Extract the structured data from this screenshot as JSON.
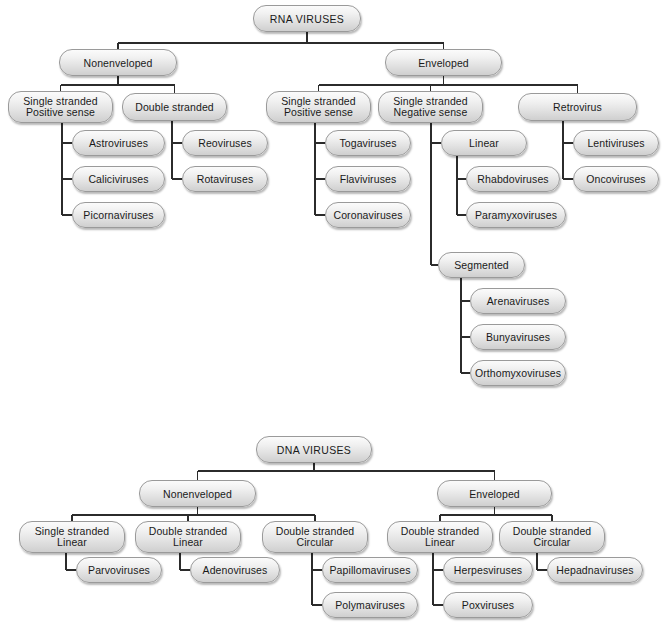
{
  "diagram": {
    "colors": {
      "background": "#ffffff",
      "node_border": "#9a9a9a",
      "node_fill_top": "#fbfbfb",
      "node_fill_bottom": "#cfcfcf",
      "connector": "#2b2b2b",
      "text": "#1a1a1a"
    },
    "trees": [
      {
        "name": "rna-viruses-tree",
        "root": "RNA VIRUSES"
      },
      {
        "name": "dna-viruses-tree",
        "root": "DNA VIRUSES"
      }
    ]
  },
  "nodes": [
    {
      "id": "rna-root",
      "label": "RNA VIRUSES",
      "x": 253,
      "y": 5,
      "w": 108,
      "h": 27,
      "kind": "root",
      "tree": "rna"
    },
    {
      "id": "rna-nonenveloped",
      "label": "Nonenveloped",
      "x": 59,
      "y": 49,
      "w": 118,
      "h": 27,
      "kind": "branch",
      "tree": "rna"
    },
    {
      "id": "rna-enveloped",
      "label": "Enveloped",
      "x": 385,
      "y": 49,
      "w": 117,
      "h": 27,
      "kind": "branch",
      "tree": "rna"
    },
    {
      "id": "rna-ne-ss-pos",
      "label": "Single stranded\nPositive sense",
      "x": 8,
      "y": 91,
      "w": 105,
      "h": 32,
      "kind": "category",
      "tree": "rna"
    },
    {
      "id": "rna-ne-ds",
      "label": "Double stranded",
      "x": 122,
      "y": 93,
      "w": 105,
      "h": 28,
      "kind": "category",
      "tree": "rna"
    },
    {
      "id": "rna-astroviruses",
      "label": "Astroviruses",
      "x": 72,
      "y": 130,
      "w": 93,
      "h": 26,
      "kind": "leaf",
      "tree": "rna"
    },
    {
      "id": "rna-caliciviruses",
      "label": "Caliciviruses",
      "x": 72,
      "y": 166,
      "w": 93,
      "h": 26,
      "kind": "leaf",
      "tree": "rna"
    },
    {
      "id": "rna-picornaviruses",
      "label": "Picornaviruses",
      "x": 72,
      "y": 202,
      "w": 93,
      "h": 26,
      "kind": "leaf",
      "tree": "rna"
    },
    {
      "id": "rna-reoviruses",
      "label": "Reoviruses",
      "x": 182,
      "y": 130,
      "w": 86,
      "h": 26,
      "kind": "leaf",
      "tree": "rna"
    },
    {
      "id": "rna-rotaviruses",
      "label": "Rotaviruses",
      "x": 182,
      "y": 166,
      "w": 86,
      "h": 26,
      "kind": "leaf",
      "tree": "rna"
    },
    {
      "id": "rna-e-ss-pos",
      "label": "Single stranded\nPositive sense",
      "x": 266,
      "y": 91,
      "w": 105,
      "h": 32,
      "kind": "category",
      "tree": "rna"
    },
    {
      "id": "rna-e-ss-neg",
      "label": "Single stranded\nNegative sense",
      "x": 378,
      "y": 91,
      "w": 105,
      "h": 32,
      "kind": "category",
      "tree": "rna"
    },
    {
      "id": "rna-retrovirus",
      "label": "Retrovirus",
      "x": 518,
      "y": 93,
      "w": 119,
      "h": 28,
      "kind": "category",
      "tree": "rna"
    },
    {
      "id": "rna-togaviruses",
      "label": "Togaviruses",
      "x": 325,
      "y": 130,
      "w": 86,
      "h": 26,
      "kind": "leaf",
      "tree": "rna"
    },
    {
      "id": "rna-flaviviruses",
      "label": "Flaviviruses",
      "x": 325,
      "y": 166,
      "w": 86,
      "h": 26,
      "kind": "leaf",
      "tree": "rna"
    },
    {
      "id": "rna-coronaviruses",
      "label": "Coronaviruses",
      "x": 325,
      "y": 202,
      "w": 86,
      "h": 26,
      "kind": "leaf",
      "tree": "rna"
    },
    {
      "id": "rna-linear",
      "label": "Linear",
      "x": 441,
      "y": 130,
      "w": 86,
      "h": 26,
      "kind": "category",
      "tree": "rna"
    },
    {
      "id": "rna-rhabdoviruses",
      "label": "Rhabdoviruses",
      "x": 466,
      "y": 166,
      "w": 94,
      "h": 26,
      "kind": "leaf",
      "tree": "rna"
    },
    {
      "id": "rna-paramyxoviruses",
      "label": "Paramyxoviruses",
      "x": 466,
      "y": 202,
      "w": 100,
      "h": 26,
      "kind": "leaf",
      "tree": "rna"
    },
    {
      "id": "rna-segmented",
      "label": "Segmented",
      "x": 438,
      "y": 252,
      "w": 87,
      "h": 26,
      "kind": "category",
      "tree": "rna"
    },
    {
      "id": "rna-arenaviruses",
      "label": "Arenaviruses",
      "x": 470,
      "y": 288,
      "w": 96,
      "h": 26,
      "kind": "leaf",
      "tree": "rna"
    },
    {
      "id": "rna-bunyaviruses",
      "label": "Bunyaviruses",
      "x": 470,
      "y": 324,
      "w": 96,
      "h": 26,
      "kind": "leaf",
      "tree": "rna"
    },
    {
      "id": "rna-orthomyxoviruses",
      "label": "Orthomyxoviruses",
      "x": 470,
      "y": 360,
      "w": 96,
      "h": 26,
      "kind": "leaf",
      "tree": "rna"
    },
    {
      "id": "dna-root",
      "label": "DNA VIRUSES",
      "x": 256,
      "y": 436,
      "w": 116,
      "h": 27,
      "kind": "root",
      "tree": "dna"
    },
    {
      "id": "dna-nonenveloped",
      "label": "Nonenveloped",
      "x": 139,
      "y": 480,
      "w": 117,
      "h": 27,
      "kind": "branch",
      "tree": "dna"
    },
    {
      "id": "dna-enveloped",
      "label": "Enveloped",
      "x": 437,
      "y": 480,
      "w": 115,
      "h": 27,
      "kind": "branch",
      "tree": "dna"
    },
    {
      "id": "dna-ne-ss-linear",
      "label": "Single stranded\nLinear",
      "x": 19,
      "y": 521,
      "w": 106,
      "h": 32,
      "kind": "category",
      "tree": "dna"
    },
    {
      "id": "dna-ne-ds-linear",
      "label": "Double stranded\nLinear",
      "x": 135,
      "y": 521,
      "w": 106,
      "h": 32,
      "kind": "category",
      "tree": "dna"
    },
    {
      "id": "dna-ne-ds-circular",
      "label": "Double stranded\nCircular",
      "x": 262,
      "y": 521,
      "w": 106,
      "h": 32,
      "kind": "category",
      "tree": "dna"
    },
    {
      "id": "dna-e-ds-linear",
      "label": "Double stranded\nLinear",
      "x": 387,
      "y": 521,
      "w": 106,
      "h": 32,
      "kind": "category",
      "tree": "dna"
    },
    {
      "id": "dna-e-ds-circular",
      "label": "Double stranded\nCircular",
      "x": 499,
      "y": 521,
      "w": 106,
      "h": 32,
      "kind": "category",
      "tree": "dna"
    },
    {
      "id": "dna-parvoviruses",
      "label": "Parvoviruses",
      "x": 76,
      "y": 557,
      "w": 86,
      "h": 26,
      "kind": "leaf",
      "tree": "dna"
    },
    {
      "id": "dna-adenoviruses",
      "label": "Adenoviruses",
      "x": 190,
      "y": 557,
      "w": 90,
      "h": 26,
      "kind": "leaf",
      "tree": "dna"
    },
    {
      "id": "dna-papillomaviruses",
      "label": "Papillomaviruses",
      "x": 322,
      "y": 557,
      "w": 96,
      "h": 26,
      "kind": "leaf",
      "tree": "dna"
    },
    {
      "id": "dna-polymaviruses",
      "label": "Polymaviruses",
      "x": 322,
      "y": 592,
      "w": 96,
      "h": 26,
      "kind": "leaf",
      "tree": "dna"
    },
    {
      "id": "dna-herpesviruses",
      "label": "Herpesviruses",
      "x": 443,
      "y": 557,
      "w": 90,
      "h": 26,
      "kind": "leaf",
      "tree": "dna"
    },
    {
      "id": "dna-poxviruses",
      "label": "Poxviruses",
      "x": 443,
      "y": 592,
      "w": 90,
      "h": 26,
      "kind": "leaf",
      "tree": "dna"
    },
    {
      "id": "dna-hepadnaviruses",
      "label": "Hepadnaviruses",
      "x": 547,
      "y": 557,
      "w": 96,
      "h": 26,
      "kind": "leaf",
      "tree": "dna"
    }
  ],
  "edges": [
    {
      "from": "rna-root",
      "to": [
        "rna-nonenveloped",
        "rna-enveloped"
      ],
      "style": "bus",
      "bus_y": 43
    },
    {
      "from": "rna-nonenveloped",
      "to": [
        "rna-ne-ss-pos",
        "rna-ne-ds"
      ],
      "style": "bus",
      "bus_y": 85
    },
    {
      "from": "rna-ne-ss-pos",
      "to": [
        "rna-astroviruses",
        "rna-caliciviruses",
        "rna-picornaviruses"
      ],
      "style": "spine",
      "spine_x": 62
    },
    {
      "from": "rna-ne-ds",
      "to": [
        "rna-reoviruses",
        "rna-rotaviruses"
      ],
      "style": "spine",
      "spine_x": 172
    },
    {
      "from": "rna-enveloped",
      "to": [
        "rna-e-ss-pos",
        "rna-e-ss-neg",
        "rna-retrovirus"
      ],
      "style": "bus",
      "bus_y": 85
    },
    {
      "from": "rna-e-ss-pos",
      "to": [
        "rna-togaviruses",
        "rna-flaviviruses",
        "rna-coronaviruses"
      ],
      "style": "spine",
      "spine_x": 315
    },
    {
      "from": "rna-e-ss-neg",
      "to": [
        "rna-linear",
        "rna-segmented"
      ],
      "style": "spine",
      "spine_x": 431
    },
    {
      "from": "rna-linear",
      "to": [
        "rna-rhabdoviruses",
        "rna-paramyxoviruses"
      ],
      "style": "spine",
      "spine_x": 457
    },
    {
      "from": "rna-retrovirus",
      "to": [
        "rna-lentiviruses",
        "rna-oncoviruses"
      ],
      "style": "spine",
      "spine_x": 563
    },
    {
      "from": "rna-segmented",
      "to": [
        "rna-arenaviruses",
        "rna-bunyaviruses",
        "rna-orthomyxoviruses"
      ],
      "style": "spine",
      "spine_x": 461
    },
    {
      "from": "dna-root",
      "to": [
        "dna-nonenveloped",
        "dna-enveloped"
      ],
      "style": "bus",
      "bus_y": 471
    },
    {
      "from": "dna-nonenveloped",
      "to": [
        "dna-ne-ss-linear",
        "dna-ne-ds-linear",
        "dna-ne-ds-circular"
      ],
      "style": "bus",
      "bus_y": 515
    },
    {
      "from": "dna-enveloped",
      "to": [
        "dna-e-ds-linear",
        "dna-e-ds-circular"
      ],
      "style": "bus",
      "bus_y": 515
    },
    {
      "from": "dna-ne-ss-linear",
      "to": [
        "dna-parvoviruses"
      ],
      "style": "spine",
      "spine_x": 66
    },
    {
      "from": "dna-ne-ds-linear",
      "to": [
        "dna-adenoviruses"
      ],
      "style": "spine",
      "spine_x": 180
    },
    {
      "from": "dna-ne-ds-circular",
      "to": [
        "dna-papillomaviruses",
        "dna-polymaviruses"
      ],
      "style": "spine",
      "spine_x": 312
    },
    {
      "from": "dna-e-ds-linear",
      "to": [
        "dna-herpesviruses",
        "dna-poxviruses"
      ],
      "style": "spine",
      "spine_x": 433
    },
    {
      "from": "dna-e-ds-circular",
      "to": [
        "dna-hepadnaviruses"
      ],
      "style": "spine",
      "spine_x": 537
    }
  ],
  "extra_nodes": [
    {
      "id": "rna-lentiviruses",
      "label": "Lentiviruses",
      "x": 573,
      "y": 130,
      "w": 86,
      "h": 26,
      "kind": "leaf",
      "tree": "rna"
    },
    {
      "id": "rna-oncoviruses",
      "label": "Oncoviruses",
      "x": 573,
      "y": 166,
      "w": 86,
      "h": 26,
      "kind": "leaf",
      "tree": "rna"
    }
  ]
}
